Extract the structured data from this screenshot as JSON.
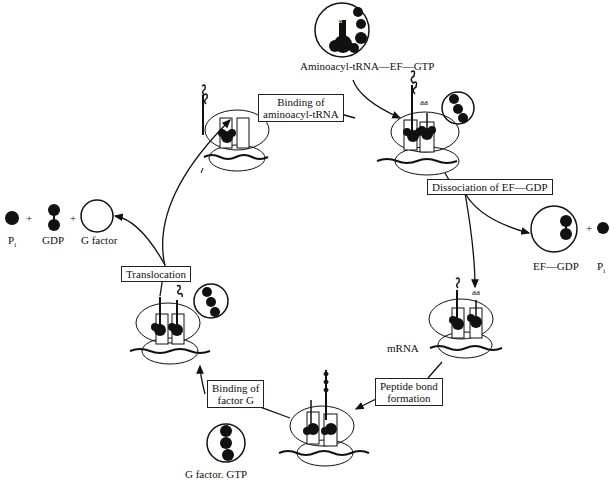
{
  "diagram": {
    "labels": {
      "aminoacyl_complex": "Aminoacyl-tRNA—EF—GTP",
      "aa_top": "aa",
      "aa_right": "aa",
      "aa_complex": "aa",
      "pi_left": "P",
      "pi_left_sub": "i",
      "gdp_left": "GDP",
      "g_factor": "G factor",
      "ef_gdp": "EF—GDP",
      "pi_right": "P",
      "pi_right_sub": "i",
      "mrna": "mRNA",
      "g_factor_gtp": "G factor. GTP",
      "plus_1": "+",
      "plus_2": "+",
      "plus_3": "+"
    },
    "steps": [
      {
        "id": "binding-aminoacyl",
        "line1": "Binding of",
        "line2": "aminoacyl-tRNA"
      },
      {
        "id": "dissociation",
        "line1": "Dissociation of EF—GDP"
      },
      {
        "id": "peptide-bond",
        "line1": "Peptide bond",
        "line2": "formation"
      },
      {
        "id": "binding-factor-g",
        "line1": "Binding of",
        "line2": "factor G"
      },
      {
        "id": "translocation",
        "line1": "Translocation"
      }
    ]
  }
}
